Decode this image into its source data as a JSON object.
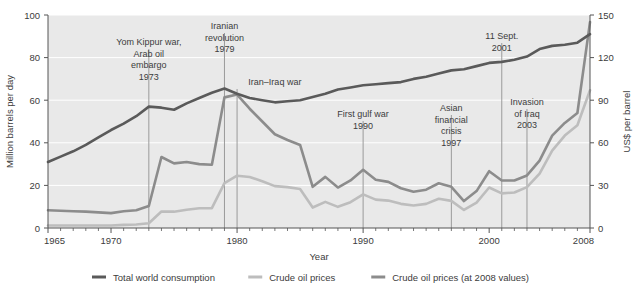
{
  "chart_data": {
    "type": "line",
    "title": "",
    "xlabel": "Year",
    "ylabel": "Million barrels per day",
    "y2label": "US$ per barrel",
    "xlim": [
      1965,
      2008
    ],
    "ylim": [
      0,
      100
    ],
    "y2lim": [
      0,
      150
    ],
    "grid": true,
    "legend_position": "bottom",
    "xticks": [
      1965,
      1970,
      1980,
      1990,
      2000,
      2008
    ],
    "xtick_labels": [
      "1965",
      "1970",
      "1980",
      "1990",
      "2000",
      "2008"
    ],
    "yticks": [
      0,
      20,
      40,
      60,
      80,
      100
    ],
    "ytick_labels": [
      "0",
      "20",
      "40",
      "60",
      "80",
      "100"
    ],
    "y2ticks": [
      0,
      30,
      60,
      90,
      120,
      150
    ],
    "y2tick_labels": [
      "0",
      "30",
      "60",
      "90",
      "120",
      "150"
    ],
    "x": [
      1965,
      1966,
      1967,
      1968,
      1969,
      1970,
      1971,
      1972,
      1973,
      1974,
      1975,
      1976,
      1977,
      1978,
      1979,
      1980,
      1981,
      1982,
      1983,
      1984,
      1985,
      1986,
      1987,
      1988,
      1989,
      1990,
      1991,
      1992,
      1993,
      1994,
      1995,
      1996,
      1997,
      1998,
      1999,
      2000,
      2001,
      2002,
      2003,
      2004,
      2005,
      2006,
      2007,
      2008
    ],
    "series": [
      {
        "name": "Total world consumption",
        "axis": "left",
        "unit": "Million barrels per day",
        "color": "#5a5a5a",
        "values": [
          31,
          33.5,
          36,
          39,
          42.5,
          46,
          49,
          52.5,
          57,
          56.5,
          55.5,
          58.5,
          61,
          63.5,
          65.5,
          63,
          61,
          60,
          59,
          59.5,
          60,
          61.5,
          63,
          65,
          66,
          67,
          67.5,
          68,
          68.5,
          70,
          71,
          72.5,
          74,
          74.5,
          76,
          77.5,
          78,
          79,
          80.5,
          84,
          85.5,
          86,
          87,
          91
        ]
      },
      {
        "name": "Crude oil prices",
        "axis": "right",
        "unit": "US$ per barrel",
        "color": "#bdbdbd",
        "values": [
          1.8,
          1.8,
          1.8,
          1.8,
          1.8,
          1.8,
          2.2,
          2.5,
          3.3,
          11.6,
          11.5,
          12.8,
          13.9,
          14.0,
          31.6,
          36.8,
          35.9,
          32.9,
          29.5,
          28.8,
          27.5,
          14.4,
          18.4,
          14.9,
          18.2,
          23.7,
          20.0,
          19.3,
          17.0,
          15.8,
          17.0,
          20.6,
          19.1,
          12.7,
          17.9,
          28.5,
          24.4,
          25.0,
          28.8,
          38.3,
          54.5,
          65.1,
          72.4,
          97.0
        ]
      },
      {
        "name": "Crude oil prices (at 2008 values)",
        "axis": "right",
        "unit": "US$ per barrel (2008)",
        "color": "#8c8c8c",
        "values": [
          12.5,
          12.2,
          11.8,
          11.5,
          11.0,
          10.5,
          11.8,
          12.5,
          15.5,
          50.0,
          45.5,
          46.5,
          45.0,
          44.5,
          92.0,
          94.0,
          84.0,
          75.0,
          66.0,
          62.0,
          58.5,
          29.0,
          36.0,
          28.5,
          33.5,
          41.0,
          34.0,
          32.5,
          28.0,
          25.5,
          27.0,
          31.5,
          29.0,
          19.0,
          26.0,
          40.0,
          33.5,
          33.5,
          37.0,
          47.5,
          65.0,
          74.0,
          81.0,
          145.0
        ]
      }
    ],
    "annotations": [
      {
        "label": "Yom Kippur war,\nArab oil\nembargo\n1973",
        "year": 1973,
        "text_x": 1973,
        "text_y_top": 30,
        "lines": [
          "Yom Kippur war,",
          "Arab oil",
          "embargo",
          "1973"
        ],
        "line_to_y": 0
      },
      {
        "label": "Iranian\nrevolution\n1979",
        "year": 1979,
        "text_x": 1979,
        "text_y_top": 14,
        "lines": [
          "Iranian",
          "revolution",
          "1979"
        ],
        "line_to_y": 0
      },
      {
        "label": "Iran–Iraq war",
        "year": 1980,
        "text_x": 1983,
        "text_y_top": 70,
        "lines": [
          "Iran–Iraq war"
        ],
        "line_to_y": 0
      },
      {
        "label": "First gulf war\n1990",
        "year": 1990,
        "text_x": 1990,
        "text_y_top": 102,
        "lines": [
          "First gulf war",
          "1990"
        ],
        "line_to_y": 0
      },
      {
        "label": "Asian\nfinancial\ncrisis\n1997",
        "year": 1997,
        "text_x": 1997,
        "text_y_top": 96,
        "lines": [
          "Asian",
          "financial",
          "crisis",
          "1997"
        ],
        "line_to_y": 0
      },
      {
        "label": "11 Sept.\n2001",
        "year": 2001,
        "text_x": 2001,
        "text_y_top": 24,
        "lines": [
          "11 Sept.",
          "2001"
        ],
        "line_to_y": 0
      },
      {
        "label": "Invasion\nof Iraq\n2003",
        "year": 2003,
        "text_x": 2003,
        "text_y_top": 90,
        "lines": [
          "Invasion",
          "of Iraq",
          "2003"
        ],
        "line_to_y": 0
      }
    ],
    "legend": [
      {
        "label": "Total world consumption",
        "color": "#5a5a5a"
      },
      {
        "label": "Crude oil prices",
        "color": "#bdbdbd"
      },
      {
        "label": "Crude oil prices (at 2008 values)",
        "color": "#8c8c8c"
      }
    ]
  },
  "colors": {
    "plot_background": "#e9e9e9",
    "page_background": "#ffffff",
    "axis": "#555555",
    "grid": "#ffffff",
    "text": "#3c3c3c",
    "annotation_line": "#9a9a9a"
  }
}
